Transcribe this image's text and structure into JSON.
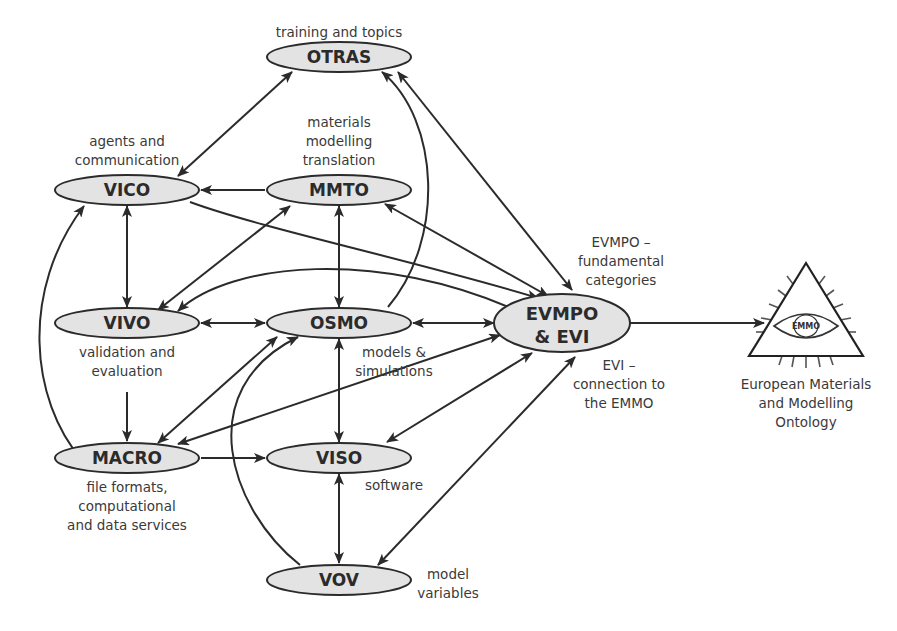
{
  "nodes": [
    {
      "id": "otras",
      "label": "OTRAS",
      "description": [
        "training and topics"
      ]
    },
    {
      "id": "vico",
      "label": "VICO",
      "description": [
        "agents and",
        "communication"
      ]
    },
    {
      "id": "mmto",
      "label": "MMTO",
      "description": [
        "materials",
        "modelling",
        "translation"
      ]
    },
    {
      "id": "vivo",
      "label": "VIVO",
      "description": [
        "validation and",
        "evaluation"
      ]
    },
    {
      "id": "osmo",
      "label": "OSMO",
      "description": [
        "models &",
        "simulations"
      ]
    },
    {
      "id": "evmpo",
      "label": [
        "EVMPO",
        "& EVI"
      ],
      "description_top": [
        "EVMPO –",
        "fundamental",
        "categories"
      ],
      "description_bottom": [
        "EVI –",
        "connection to",
        "the EMMO"
      ]
    },
    {
      "id": "macro",
      "label": "MACRO",
      "description": [
        "file formats,",
        "computational",
        "and data services"
      ]
    },
    {
      "id": "viso",
      "label": "VISO",
      "description": [
        "software"
      ]
    },
    {
      "id": "vov",
      "label": "VOV",
      "description": [
        "model",
        "variables"
      ]
    }
  ],
  "emmo": {
    "logo_text": "EMMO",
    "caption": [
      "European Materials",
      "and Modelling",
      "Ontology"
    ]
  },
  "edges": [
    {
      "from": "otras",
      "to": "vico",
      "type": "bidirectional"
    },
    {
      "from": "otras",
      "to": "evmpo",
      "type": "bidirectional"
    },
    {
      "from": "osmo",
      "to": "otras",
      "type": "directed"
    },
    {
      "from": "mmto",
      "to": "vico",
      "type": "directed"
    },
    {
      "from": "vico",
      "to": "evmpo",
      "type": "directed"
    },
    {
      "from": "vico",
      "to": "vivo",
      "type": "bidirectional"
    },
    {
      "from": "vico",
      "to": "macro",
      "type": "bidirectional"
    },
    {
      "from": "mmto",
      "to": "vivo",
      "type": "bidirectional"
    },
    {
      "from": "mmto",
      "to": "osmo",
      "type": "bidirectional"
    },
    {
      "from": "mmto",
      "to": "evmpo",
      "type": "bidirectional"
    },
    {
      "from": "vivo",
      "to": "evmpo",
      "type": "bidirectional"
    },
    {
      "from": "vivo",
      "to": "osmo",
      "type": "bidirectional"
    },
    {
      "from": "vivo",
      "to": "macro",
      "type": "directed"
    },
    {
      "from": "osmo",
      "to": "evmpo",
      "type": "bidirectional"
    },
    {
      "from": "osmo",
      "to": "macro",
      "type": "bidirectional"
    },
    {
      "from": "osmo",
      "to": "viso",
      "type": "bidirectional"
    },
    {
      "from": "vov",
      "to": "osmo",
      "type": "directed"
    },
    {
      "from": "macro",
      "to": "evmpo",
      "type": "bidirectional"
    },
    {
      "from": "macro",
      "to": "viso",
      "type": "directed"
    },
    {
      "from": "viso",
      "to": "evmpo",
      "type": "bidirectional"
    },
    {
      "from": "viso",
      "to": "vov",
      "type": "bidirectional"
    },
    {
      "from": "vov",
      "to": "evmpo",
      "type": "bidirectional"
    },
    {
      "from": "evmpo",
      "to": "emmo",
      "type": "directed"
    }
  ]
}
